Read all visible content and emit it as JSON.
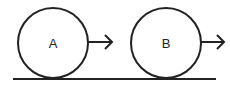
{
  "diagram": {
    "ground": {
      "x1": 13,
      "x2": 216,
      "y": 79,
      "color": "#222222"
    },
    "objects": [
      {
        "label": "A",
        "cx": 53,
        "cy": 43,
        "r": 35,
        "arrow": {
          "x1": 88,
          "x2": 112,
          "y": 42
        }
      },
      {
        "label": "B",
        "cx": 166,
        "cy": 43,
        "r": 35,
        "arrow": {
          "x1": 201,
          "x2": 224,
          "y": 42
        }
      }
    ]
  }
}
